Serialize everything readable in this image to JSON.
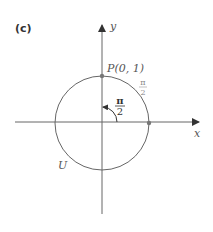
{
  "panel_label": "(c)",
  "axes": {
    "x_label": "x",
    "y_label": "y"
  },
  "point_label": "P(0, 1)",
  "circle_label": "U",
  "angle_label": {
    "num": "π",
    "den": "2"
  },
  "arc_label": {
    "num": "π",
    "den": "2"
  },
  "colors": {
    "axis": "#555555",
    "circle": "#666666",
    "point": "#777777",
    "text": "#555555"
  }
}
